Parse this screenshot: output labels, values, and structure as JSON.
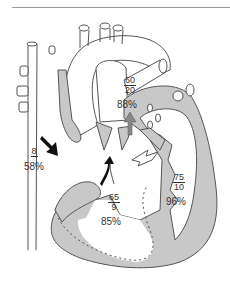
{
  "figure": {
    "type": "heart-diagram",
    "colors": {
      "myocardium": "#c8c8c8",
      "outline": "#555555",
      "background": "#ffffff",
      "text": "#333333"
    },
    "labels": {
      "right_atrium": {
        "pressure": "8",
        "saturation": "58%"
      },
      "pulmonary_artery": {
        "systolic": "60",
        "diastolic": "20",
        "saturation": "88%"
      },
      "right_ventricle": {
        "systolic": "65",
        "diastolic": "9",
        "saturation": "85%"
      },
      "left_ventricle": {
        "systolic": "75",
        "diastolic": "10",
        "saturation": "96%"
      }
    },
    "arrows": [
      {
        "name": "black-arrow-right-atrium",
        "fill": "black"
      },
      {
        "name": "gray-arrow-pulmonary",
        "fill": "gray"
      },
      {
        "name": "white-arrow-shunt",
        "fill": "white"
      },
      {
        "name": "black-white-arrow-rv",
        "fill": "mixed"
      }
    ]
  }
}
